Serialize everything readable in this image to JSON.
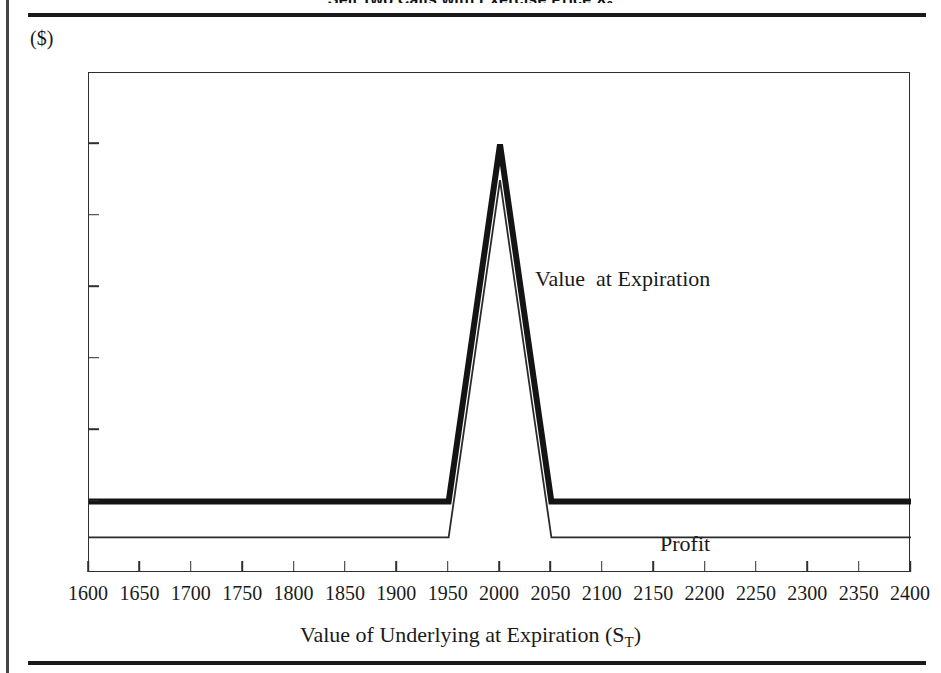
{
  "title": {
    "text": "Sell Two Calls with Exercise Price X",
    "subscript": "2"
  },
  "axes": {
    "y_unit_label": "($)",
    "x_axis_title": "Value of Underlying at Expiration (S",
    "x_axis_title_sub": "T",
    "x_axis_title_close": ")"
  },
  "annotations": {
    "value_line": "Value  at Expiration",
    "profit_line": "Profit"
  },
  "chart_data": {
    "type": "line",
    "title": "Sell Two Calls with Exercise Price X2",
    "xlabel": "Value of Underlying at Expiration (ST)",
    "ylabel": "($)",
    "xlim": [
      1600,
      2400
    ],
    "ylim": [
      -10,
      60
    ],
    "xticks": [
      1600,
      1650,
      1700,
      1750,
      1800,
      1850,
      1900,
      1950,
      2000,
      2050,
      2100,
      2150,
      2200,
      2250,
      2300,
      2350,
      2400
    ],
    "yticks": [
      -10,
      0,
      10,
      20,
      30,
      40,
      50,
      60
    ],
    "grid": false,
    "legend": "inline-annotation",
    "series": [
      {
        "name": "Value  at Expiration",
        "style": "thick",
        "color": "#141414",
        "x": [
          1600,
          1950,
          2000,
          2050,
          2400
        ],
        "values": [
          0,
          0,
          50,
          0,
          0
        ]
      },
      {
        "name": "Profit",
        "style": "thin",
        "color": "#2b2b2b",
        "x": [
          1600,
          1950,
          2000,
          2050,
          2400
        ],
        "values": [
          -5,
          -5,
          45,
          -5,
          -5
        ]
      }
    ]
  }
}
